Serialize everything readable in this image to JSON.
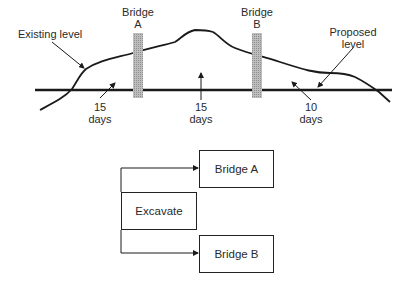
{
  "profile": {
    "bridge_a": {
      "line1": "Bridge",
      "line2": "A"
    },
    "bridge_b": {
      "line1": "Bridge",
      "line2": "B"
    },
    "existing_level": "Existing level",
    "proposed_level": {
      "line1": "Proposed",
      "line2": "level"
    },
    "durations": [
      {
        "value": "15",
        "unit": "days"
      },
      {
        "value": "15",
        "unit": "days"
      },
      {
        "value": "10",
        "unit": "days"
      }
    ]
  },
  "network": {
    "excavate": "Excavate",
    "bridge_a": "Bridge A",
    "bridge_b": "Bridge B"
  },
  "colors": {
    "line": "#1a1a1a",
    "pillar": "#a8a8a8",
    "text": "#2a2a2a"
  }
}
